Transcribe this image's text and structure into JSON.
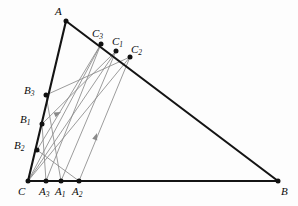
{
  "figure": {
    "background_color": "#fdfdfd",
    "outline_color": "#141414",
    "inner_line_color": "#8a8a8a",
    "point_color": "#111111",
    "label_color": "#0b0b0b"
  },
  "vertices": {
    "A": {
      "label": "A",
      "sub": "",
      "x": 66,
      "y": 21,
      "label_x": 55,
      "label_y": 6
    },
    "B": {
      "label": "B",
      "sub": "",
      "x": 278,
      "y": 181,
      "label_x": 281,
      "label_y": 186
    },
    "C": {
      "label": "C",
      "sub": "",
      "x": 28,
      "y": 181,
      "label_x": 18,
      "label_y": 186
    }
  },
  "points_on_AB": [
    {
      "label": "C",
      "sub": "3",
      "x": 101,
      "y": 44,
      "label_x": 92,
      "label_y": 28
    },
    {
      "label": "C",
      "sub": "1",
      "x": 116,
      "y": 51,
      "label_x": 112,
      "label_y": 36
    },
    {
      "label": "C",
      "sub": "2",
      "x": 130,
      "y": 57,
      "label_x": 131,
      "label_y": 44
    }
  ],
  "points_on_AC": [
    {
      "label": "B",
      "sub": "3",
      "x": 46,
      "y": 95,
      "label_x": 24,
      "label_y": 85
    },
    {
      "label": "B",
      "sub": "1",
      "x": 42,
      "y": 124,
      "label_x": 20,
      "label_y": 114
    },
    {
      "label": "B",
      "sub": "2",
      "x": 37,
      "y": 150,
      "label_x": 14,
      "label_y": 140
    }
  ],
  "points_on_CB": [
    {
      "label": "A",
      "sub": "3",
      "x": 46,
      "y": 181,
      "label_x": 39,
      "label_y": 186
    },
    {
      "label": "A",
      "sub": "1",
      "x": 61,
      "y": 181,
      "label_x": 55,
      "label_y": 186
    },
    {
      "label": "A",
      "sub": "2",
      "x": 79,
      "y": 181,
      "label_x": 72,
      "label_y": 186
    }
  ],
  "triangle_edges": [
    {
      "name": "edge-A-B",
      "from": "A",
      "to": "B"
    },
    {
      "name": "edge-C-B",
      "from": "C",
      "to": "B"
    },
    {
      "name": "edge-A-C",
      "from": "A",
      "to": "C"
    }
  ],
  "cevians": [
    {
      "name": "cevian-C-to-C3",
      "x1": 28,
      "y1": 181,
      "x2": 101,
      "y2": 44
    },
    {
      "name": "cevian-C-to-C1",
      "x1": 28,
      "y1": 181,
      "x2": 116,
      "y2": 51
    },
    {
      "name": "cevian-C-to-C2",
      "x1": 28,
      "y1": 181,
      "x2": 130,
      "y2": 57
    },
    {
      "name": "cevian-A3-to-C3",
      "x1": 46,
      "y1": 181,
      "x2": 101,
      "y2": 44
    },
    {
      "name": "cevian-A1-to-C1",
      "x1": 61,
      "y1": 181,
      "x2": 116,
      "y2": 51
    },
    {
      "name": "cevian-A2-to-C2",
      "x1": 79,
      "y1": 181,
      "x2": 130,
      "y2": 57
    },
    {
      "name": "cevian-B3-to-C2",
      "x1": 46,
      "y1": 95,
      "x2": 130,
      "y2": 57
    },
    {
      "name": "cevian-B1-to-C1",
      "x1": 42,
      "y1": 124,
      "x2": 116,
      "y2": 51
    },
    {
      "name": "cevian-B2-to-C3",
      "x1": 37,
      "y1": 150,
      "x2": 101,
      "y2": 44
    },
    {
      "name": "cevian-B3-to-A1",
      "x1": 46,
      "y1": 95,
      "x2": 61,
      "y2": 181
    },
    {
      "name": "cevian-B1-to-A3",
      "x1": 42,
      "y1": 124,
      "x2": 46,
      "y2": 181
    },
    {
      "name": "cevian-B2-to-A2",
      "x1": 37,
      "y1": 150,
      "x2": 79,
      "y2": 181
    }
  ],
  "direction_arrows": [
    {
      "name": "arrow-B3-toward-C2",
      "x": 61,
      "y": 112,
      "angle": 336
    },
    {
      "name": "arrow-A2-toward-C2",
      "x": 97,
      "y": 133,
      "angle": 289
    }
  ]
}
